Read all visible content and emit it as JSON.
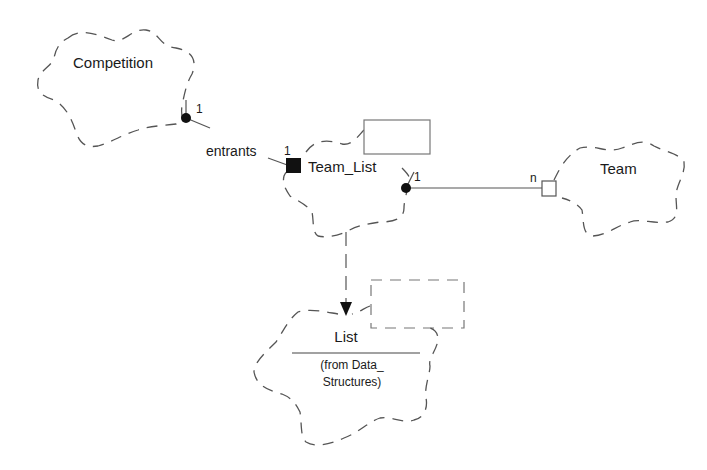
{
  "diagram": {
    "classes": [
      {
        "id": "competition",
        "name": "Competition"
      },
      {
        "id": "team_list",
        "name": "Team_List"
      },
      {
        "id": "team",
        "name": "Team"
      },
      {
        "id": "list",
        "name": "List",
        "note_line1": "(from Data_",
        "note_line2": "Structures)"
      }
    ],
    "associations": [
      {
        "from": "Competition",
        "to": "Team_List",
        "role": "entrants",
        "from_mult": "1",
        "to_mult": "1",
        "to_adornment": "filled-square"
      },
      {
        "from": "Team_List",
        "to": "Team",
        "from_mult": "1",
        "to_mult": "n",
        "to_adornment": "hollow-square"
      }
    ],
    "dependencies": [
      {
        "from": "Team_List",
        "to": "List",
        "style": "dashed-arrow"
      }
    ]
  }
}
